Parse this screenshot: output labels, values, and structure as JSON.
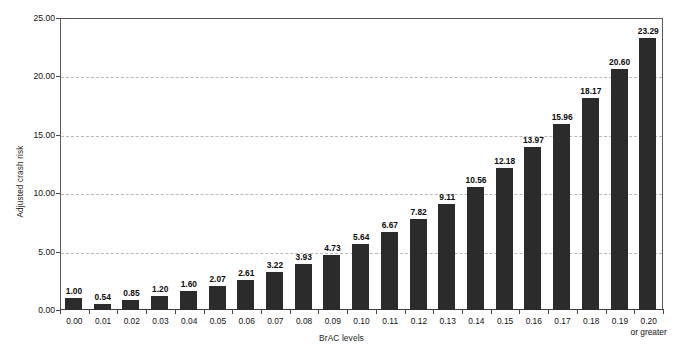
{
  "chart_data": {
    "type": "bar",
    "title": "",
    "xlabel": "BrAC levels",
    "ylabel": "Adjusted crash risk",
    "ylim": [
      0,
      25
    ],
    "ytick_labels": [
      "0.00",
      "5.00",
      "10.00",
      "15.00",
      "20.00",
      "25.00"
    ],
    "ytick_values": [
      0,
      5,
      10,
      15,
      20,
      25
    ],
    "grid": true,
    "grid_style": "dashed-horizontal",
    "legend": "none",
    "bar_color": "#2b2b2b",
    "categories": [
      "0.00",
      "0.01",
      "0.02",
      "0.03",
      "0.04",
      "0.05",
      "0.06",
      "0.07",
      "0.08",
      "0.09",
      "0.10",
      "0.11",
      "0.12",
      "0.13",
      "0.14",
      "0.15",
      "0.16",
      "0.17",
      "0.18",
      "0.19",
      "0.20"
    ],
    "last_category_sublabel": "or greater",
    "values": [
      1.0,
      0.54,
      0.85,
      1.2,
      1.6,
      2.07,
      2.61,
      3.22,
      3.93,
      4.73,
      5.64,
      6.67,
      7.82,
      9.11,
      10.56,
      12.18,
      13.97,
      15.96,
      18.17,
      20.6,
      23.29
    ],
    "value_labels": [
      "1.00",
      "0.54",
      "0.85",
      "1.20",
      "1.60",
      "2.07",
      "2.61",
      "3.22",
      "3.93",
      "4.73",
      "5.64",
      "6.67",
      "7.82",
      "9.11",
      "10.56",
      "12.18",
      "13.97",
      "15.96",
      "18.17",
      "20.60",
      "23.29"
    ]
  }
}
